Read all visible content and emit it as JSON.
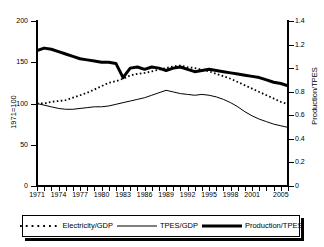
{
  "chart_data": {
    "type": "line",
    "title": "",
    "xlabel": "",
    "ylabel": "1971=100",
    "ylabel_right": "Production/TPES",
    "ylim": [
      0,
      200
    ],
    "ylim_right": [
      0,
      1.4
    ],
    "grid": false,
    "legend_position": "bottom",
    "x": [
      1971,
      1972,
      1973,
      1974,
      1975,
      1976,
      1977,
      1978,
      1979,
      1980,
      1981,
      1982,
      1983,
      1984,
      1985,
      1986,
      1987,
      1988,
      1989,
      1990,
      1991,
      1992,
      1993,
      1994,
      1995,
      1996,
      1997,
      1998,
      1999,
      2000,
      2001,
      2002,
      2003,
      2004,
      2005,
      2006
    ],
    "yticks_left": [
      0,
      50,
      100,
      150,
      200
    ],
    "yticks_right": [
      0,
      0.2,
      0.4,
      0.6,
      0.8,
      1,
      1.2,
      1.4
    ],
    "xticks_labeled": [
      1971,
      1974,
      1977,
      1980,
      1983,
      1986,
      1989,
      1992,
      1995,
      1998,
      2001,
      2005
    ],
    "series": [
      {
        "name": "Electricity/GDP",
        "style": "dotted",
        "axis": "left",
        "values": [
          100,
          100,
          102,
          103,
          104,
          107,
          110,
          113,
          117,
          121,
          125,
          127,
          130,
          134,
          136,
          137,
          139,
          141,
          143,
          145,
          146,
          144,
          143,
          141,
          139,
          136,
          133,
          130,
          126,
          122,
          118,
          114,
          110,
          106,
          102,
          99
        ]
      },
      {
        "name": "TPES/GDP",
        "style": "thin-solid",
        "axis": "left",
        "values": [
          100,
          98,
          96,
          94,
          93,
          93,
          94,
          95,
          96,
          96,
          97,
          99,
          101,
          103,
          105,
          107,
          110,
          113,
          116,
          114,
          112,
          111,
          110,
          111,
          110,
          108,
          105,
          101,
          96,
          90,
          85,
          81,
          78,
          75,
          73,
          71
        ]
      },
      {
        "name": "Production/TPES",
        "style": "thick-solid",
        "axis": "right",
        "values": [
          1.15,
          1.17,
          1.16,
          1.14,
          1.12,
          1.1,
          1.08,
          1.07,
          1.06,
          1.05,
          1.05,
          1.04,
          0.92,
          1.0,
          1.01,
          0.99,
          1.01,
          1.0,
          0.98,
          1.0,
          1.01,
          0.99,
          0.97,
          0.98,
          0.99,
          0.98,
          0.97,
          0.96,
          0.95,
          0.94,
          0.93,
          0.92,
          0.9,
          0.88,
          0.87,
          0.85
        ]
      }
    ]
  },
  "legend": {
    "items": [
      {
        "label": "Electricity/GDP",
        "style": "dotted"
      },
      {
        "label": "TPES/GDP",
        "style": "thin-solid"
      },
      {
        "label": "Production/TPES",
        "style": "thick-solid"
      }
    ]
  }
}
